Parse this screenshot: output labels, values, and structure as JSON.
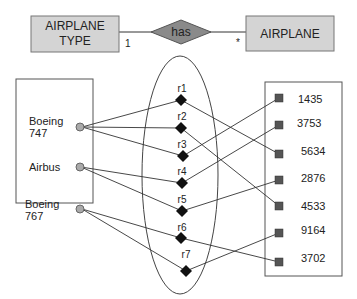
{
  "er": {
    "left_entity": {
      "line1": "AIRPLANE",
      "line2": "TYPE"
    },
    "relationship": "has",
    "right_entity": "AIRPLANE",
    "left_cardinality": "1",
    "right_cardinality": "*"
  },
  "types": [
    {
      "line1": "Boeing",
      "line2": "747"
    },
    {
      "line1": "Airbus",
      "line2": ""
    },
    {
      "line1": "Boeing",
      "line2": "767"
    }
  ],
  "relations": [
    "r1",
    "r2",
    "r3",
    "r4",
    "r5",
    "r6",
    "r7"
  ],
  "airplanes": [
    "1435",
    "3753",
    "5634",
    "2876",
    "4533",
    "9164",
    "3702"
  ],
  "links": {
    "type_to_relation": [
      [
        0,
        0
      ],
      [
        0,
        1
      ],
      [
        0,
        2
      ],
      [
        1,
        3
      ],
      [
        1,
        4
      ],
      [
        2,
        5
      ],
      [
        2,
        6
      ]
    ],
    "relation_to_airplane": [
      [
        0,
        2
      ],
      [
        1,
        4
      ],
      [
        2,
        0
      ],
      [
        3,
        1
      ],
      [
        4,
        3
      ],
      [
        5,
        6
      ],
      [
        6,
        5
      ]
    ]
  },
  "colors": {
    "entity_fill": "#d4d4d4",
    "diamond_fill": "#8a8a8a",
    "dot_fill": "#aaaaaa",
    "square_fill": "#555555"
  }
}
